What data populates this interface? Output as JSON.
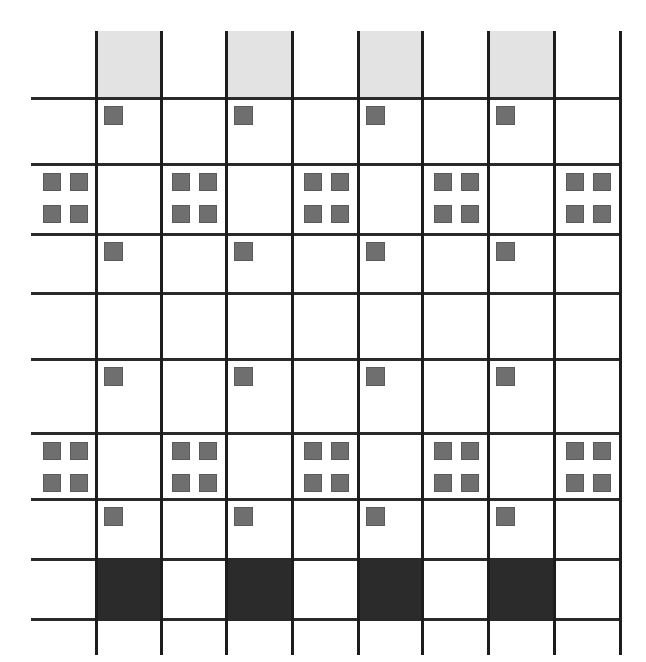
{
  "figure": {
    "type": "grid-pattern-diagram",
    "width": 646,
    "height": 662,
    "background_color": "#ffffff"
  },
  "palette": {
    "grid_line": "#1d1d1d",
    "grid_line_horizontal": "#2a2a2a",
    "light_shade": "#e3e3e3",
    "light_shade_border": "#d4d4d4",
    "marker": "#6f6f6f",
    "marker_border": "#5a5a5a",
    "dark_fill": "#2b2b2b",
    "paper": "#ffffff"
  },
  "grid": {
    "vertical_line_x": [
      95,
      160,
      225,
      291,
      357,
      421,
      487,
      553,
      619
    ],
    "horizontal_line_y": [
      97,
      163,
      233,
      292,
      358,
      432,
      498,
      558,
      618
    ],
    "vertical_line_top": 31,
    "vertical_line_bottom": 655,
    "horizontal_line_left": 31,
    "horizontal_line_right": 619,
    "line_thickness_vertical": 3,
    "line_thickness_horizontal": 3,
    "column_count": 9,
    "row_count": 9,
    "column_edges": [
      31,
      95,
      160,
      225,
      291,
      357,
      421,
      487,
      553,
      619
    ],
    "row_edges": [
      31,
      97,
      163,
      233,
      292,
      358,
      432,
      498,
      558,
      618
    ]
  },
  "rows": [
    {
      "index": 0,
      "name": "header-shade-row",
      "y_top": 31,
      "y_bottom": 97,
      "content": "light-shade",
      "columns": [
        1,
        3,
        5,
        7
      ]
    },
    {
      "index": 1,
      "name": "single-marker-row-1",
      "y_top": 97,
      "y_bottom": 163,
      "content": "single-marker",
      "columns": [
        1,
        3,
        5,
        7
      ]
    },
    {
      "index": 2,
      "name": "quad-marker-row-1",
      "y_top": 163,
      "y_bottom": 233,
      "content": "quad-marker",
      "columns": [
        0,
        2,
        4,
        6,
        8
      ]
    },
    {
      "index": 3,
      "name": "single-marker-row-2",
      "y_top": 233,
      "y_bottom": 292,
      "content": "single-marker",
      "columns": [
        1,
        3,
        5,
        7
      ]
    },
    {
      "index": 4,
      "name": "empty-row",
      "y_top": 292,
      "y_bottom": 358,
      "content": "empty",
      "columns": []
    },
    {
      "index": 5,
      "name": "single-marker-row-3",
      "y_top": 358,
      "y_bottom": 432,
      "content": "single-marker",
      "columns": [
        1,
        3,
        5,
        7
      ]
    },
    {
      "index": 6,
      "name": "quad-marker-row-2",
      "y_top": 432,
      "y_bottom": 498,
      "content": "quad-marker",
      "columns": [
        0,
        2,
        4,
        6,
        8
      ]
    },
    {
      "index": 7,
      "name": "single-marker-row-4",
      "y_top": 498,
      "y_bottom": 558,
      "content": "single-marker",
      "columns": [
        1,
        3,
        5,
        7
      ]
    },
    {
      "index": 8,
      "name": "footer-dark-row",
      "y_top": 558,
      "y_bottom": 618,
      "content": "dark-fill",
      "columns": [
        1,
        3,
        5,
        7
      ]
    }
  ],
  "marker": {
    "size": 19,
    "single_offset_x": 9,
    "single_offset_y": 9,
    "quad_size": 18,
    "quad_gap": 9,
    "quad_offset_x": 2,
    "quad_offset_y": 10
  }
}
